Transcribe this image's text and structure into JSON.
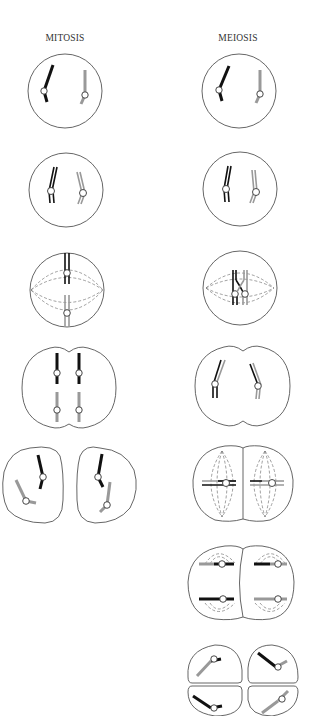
{
  "labels": {
    "mitosis": "MITOSIS",
    "meiosis": "MEIOSIS"
  },
  "colors": {
    "maternal_chromosome": "#111111",
    "paternal_chromosome": "#999999",
    "cell_outline": "#555555",
    "spindle": "#777777"
  },
  "mitosis_stages": [
    {
      "stage": "interphase / G1",
      "cells": 1
    },
    {
      "stage": "prophase (replicated)",
      "cells": 1
    },
    {
      "stage": "metaphase",
      "cells": 1
    },
    {
      "stage": "anaphase",
      "cells": 1
    },
    {
      "stage": "telophase / cytokinesis",
      "cells": 2
    }
  ],
  "meiosis_stages": [
    {
      "stage": "interphase / G1",
      "cells": 1
    },
    {
      "stage": "prophase I (replicated)",
      "cells": 1
    },
    {
      "stage": "metaphase I (crossing over)",
      "cells": 1
    },
    {
      "stage": "anaphase I",
      "cells": 1
    },
    {
      "stage": "metaphase II",
      "cells": 2
    },
    {
      "stage": "anaphase II",
      "cells": 2
    },
    {
      "stage": "telophase II / four daughter cells",
      "cells": 4
    }
  ]
}
